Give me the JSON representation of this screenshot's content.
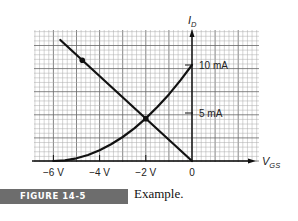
{
  "chart_data": {
    "type": "line",
    "title": "",
    "xlabel": "V_GS",
    "ylabel": "I_D",
    "xlabel_main": "V",
    "xlabel_sub": "GS",
    "ylabel_main": "I",
    "ylabel_sub": "D",
    "x_tick_labels": [
      "−6 V",
      "−4 V",
      "−2 V",
      "0"
    ],
    "x_ticks": [
      -6,
      -4,
      -2,
      0
    ],
    "y_tick_labels": [
      "5 mA",
      "10 mA"
    ],
    "y_ticks": [
      5,
      10
    ],
    "xlim": [
      -6.8,
      2.9
    ],
    "ylim": [
      0,
      13.8
    ],
    "grid": true,
    "legend": null,
    "series": [
      {
        "name": "Transfer characteristic curve",
        "x": [
          -6,
          -5.5,
          -5,
          -4.5,
          -4,
          -3.5,
          -3,
          -2.5,
          -2,
          -1.5,
          -1,
          -0.5,
          0
        ],
        "y": [
          0,
          0.07,
          0.28,
          0.63,
          1.11,
          1.74,
          2.5,
          3.4,
          4.44,
          5.63,
          6.94,
          8.4,
          10
        ]
      },
      {
        "name": "Load line",
        "x": [
          -5.7,
          0
        ],
        "y": [
          12.6,
          0
        ]
      }
    ],
    "annotations": [
      {
        "type": "point",
        "series": "Load line",
        "x": -4.75,
        "y": 10.5
      },
      {
        "type": "intersection",
        "x": -2.0,
        "y": 4.4
      }
    ]
  },
  "figure": {
    "label": "FIGURE 14-5",
    "caption": "Example."
  }
}
